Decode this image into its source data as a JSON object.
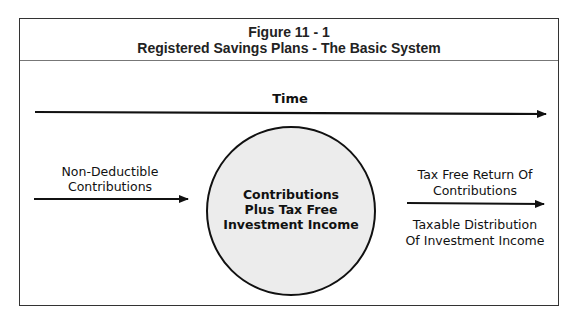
{
  "figure": {
    "number": "Figure 11 - 1",
    "title": "Registered Savings Plans - The Basic System"
  },
  "timeline": {
    "label": "Time"
  },
  "inflow": {
    "line1": "Non-Deductible",
    "line2": "Contributions"
  },
  "center_circle": {
    "line1": "Contributions",
    "line2": "Plus Tax Free",
    "line3": "Investment Income",
    "fill_color": "#ececec",
    "stroke_color": "#111111"
  },
  "outflow": {
    "above_line1": "Tax Free Return Of",
    "above_line2": "Contributions",
    "below_line1": "Taxable Distribution",
    "below_line2": "Of Investment Income"
  }
}
